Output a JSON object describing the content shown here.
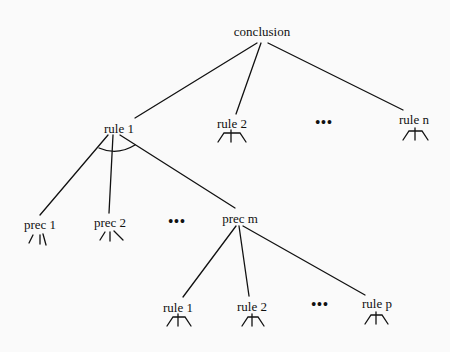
{
  "diagram": {
    "type": "and-or proof tree",
    "root": {
      "label": "conclusion"
    },
    "level1": [
      {
        "label": "rule 1"
      },
      {
        "label": "rule 2"
      },
      {
        "label": "..."
      },
      {
        "label": "rule n"
      }
    ],
    "level2": [
      {
        "label": "prec 1"
      },
      {
        "label": "prec 2"
      },
      {
        "label": "..."
      },
      {
        "label": "prec m"
      }
    ],
    "level3": [
      {
        "label": "rule 1"
      },
      {
        "label": "rule 2"
      },
      {
        "label": "..."
      },
      {
        "label": "rule p"
      }
    ],
    "ellipsis": "•••",
    "colors": {
      "line": "#111111",
      "background": "#fafafa"
    }
  }
}
